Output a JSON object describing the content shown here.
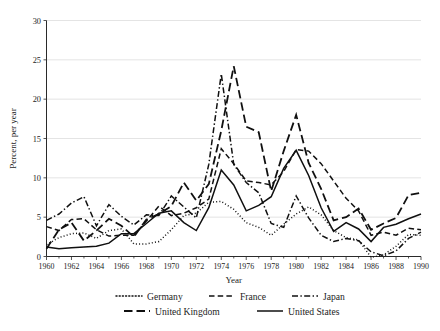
{
  "chart_data": {
    "type": "line",
    "title": "",
    "xlabel": "Year",
    "ylabel": "Percent, per year",
    "xlim": [
      1960,
      1990
    ],
    "ylim": [
      0,
      30
    ],
    "ytick_values": [
      0,
      5,
      10,
      15,
      20,
      25,
      30
    ],
    "ytick_labels": [
      "0",
      "5",
      "10",
      "15",
      "20",
      "25",
      "30"
    ],
    "xtick_values": [
      1960,
      1962,
      1964,
      1966,
      1968,
      1970,
      1972,
      1974,
      1976,
      1978,
      1980,
      1982,
      1984,
      1986,
      1988,
      1990
    ],
    "xtick_labels": [
      "1960",
      "1962",
      "1964",
      "1966",
      "1968",
      "1970",
      "1972",
      "1974",
      "1976",
      "1978",
      "1980",
      "1982",
      "1984",
      "1986",
      "1988",
      "1990"
    ],
    "grid": "horizontal",
    "legend_position": "bottom",
    "x": [
      1960,
      1961,
      1962,
      1963,
      1964,
      1965,
      1966,
      1967,
      1968,
      1969,
      1970,
      1971,
      1972,
      1973,
      1974,
      1975,
      1976,
      1977,
      1978,
      1979,
      1980,
      1981,
      1982,
      1983,
      1984,
      1985,
      1986,
      1987,
      1988,
      1989,
      1990
    ],
    "series": [
      {
        "name": "Germany",
        "style": "dotted",
        "dash": "1,2.2",
        "width": 1.5,
        "values": [
          1.5,
          2.4,
          2.9,
          3.0,
          2.3,
          3.3,
          3.5,
          1.6,
          1.6,
          1.9,
          3.4,
          5.2,
          5.5,
          6.9,
          7.0,
          6.0,
          4.3,
          3.7,
          2.7,
          4.1,
          5.4,
          6.3,
          5.3,
          3.3,
          2.4,
          2.1,
          -0.1,
          0.2,
          1.3,
          2.8,
          2.7
        ]
      },
      {
        "name": "France",
        "style": "dashed",
        "dash": "5.5,3.2",
        "width": 1.5,
        "values": [
          3.8,
          3.3,
          4.7,
          4.8,
          3.4,
          2.6,
          2.7,
          2.7,
          4.5,
          6.4,
          5.2,
          5.5,
          6.2,
          7.3,
          13.7,
          11.8,
          9.6,
          9.4,
          9.1,
          10.8,
          13.6,
          13.4,
          11.8,
          9.6,
          7.4,
          5.8,
          2.7,
          3.1,
          2.7,
          3.6,
          3.4
        ]
      },
      {
        "name": "Japan",
        "style": "dash-dot",
        "dash": "6,2.4,1.4,2.4",
        "width": 1.5,
        "values": [
          4.6,
          5.4,
          6.8,
          7.6,
          3.9,
          6.6,
          5.1,
          4.0,
          5.3,
          5.2,
          7.7,
          6.3,
          4.9,
          11.7,
          23.2,
          11.7,
          9.4,
          8.1,
          4.2,
          3.7,
          7.7,
          4.9,
          2.7,
          1.9,
          2.3,
          2.0,
          0.6,
          0.1,
          0.7,
          2.3,
          3.1
        ]
      },
      {
        "name": "United Kingdom",
        "style": "long-dash",
        "dash": "8.5,4",
        "width": 1.8,
        "values": [
          1.0,
          3.4,
          4.3,
          2.0,
          3.3,
          4.8,
          3.9,
          2.5,
          4.7,
          5.4,
          6.4,
          9.4,
          7.1,
          9.2,
          16.0,
          24.2,
          16.5,
          15.8,
          8.3,
          13.4,
          18.0,
          11.9,
          8.6,
          4.6,
          5.0,
          6.1,
          3.4,
          4.2,
          4.9,
          7.8,
          8.1
        ]
      },
      {
        "name": "United States",
        "style": "solid",
        "dash": "",
        "width": 1.5,
        "values": [
          1.2,
          1.0,
          1.1,
          1.2,
          1.3,
          1.7,
          2.9,
          2.9,
          4.2,
          5.5,
          5.8,
          4.3,
          3.3,
          6.2,
          11.0,
          9.1,
          5.8,
          6.5,
          7.6,
          11.2,
          13.5,
          10.3,
          6.2,
          3.2,
          4.3,
          3.5,
          1.9,
          3.7,
          4.1,
          4.8,
          5.4
        ]
      }
    ],
    "legend": [
      {
        "label": "Germany",
        "style": "dotted"
      },
      {
        "label": "France",
        "style": "dashed"
      },
      {
        "label": "Japan",
        "style": "dash-dot"
      },
      {
        "label": "United Kingdom",
        "style": "long-dash"
      },
      {
        "label": "United States",
        "style": "solid"
      }
    ]
  }
}
